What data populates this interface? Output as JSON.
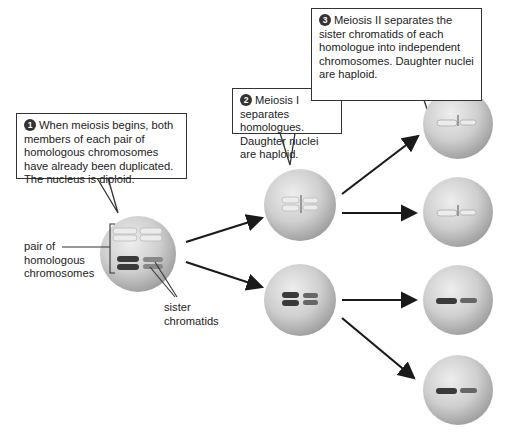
{
  "callouts": [
    {
      "number": "1",
      "text": "When meiosis begins, both members of each pair of homologous chromosomes have already been duplicated. The nucleus is diploid."
    },
    {
      "number": "2",
      "text": "Meiosis I separates homologues. Daughter nuclei are haploid."
    },
    {
      "number": "3",
      "text": "Meiosis II separates the sister chromatids of each homologue into independent chromosomes. Daughter nuclei are haploid."
    }
  ],
  "labels": {
    "homologous_pair": "pair of homologous chromosomes",
    "sister_chromatids": "sister chromatids"
  },
  "cells": [
    {
      "id": "parent",
      "stage": "diploid, duplicated",
      "chromosomes": [
        "light-duplicated",
        "dark-duplicated"
      ]
    },
    {
      "id": "meiosis1-top",
      "stage": "haploid",
      "chromosomes": [
        "light-duplicated"
      ]
    },
    {
      "id": "meiosis1-bottom",
      "stage": "haploid",
      "chromosomes": [
        "dark-duplicated"
      ]
    },
    {
      "id": "meiosis2-1",
      "stage": "haploid",
      "chromosomes": [
        "light-single"
      ]
    },
    {
      "id": "meiosis2-2",
      "stage": "haploid",
      "chromosomes": [
        "light-single"
      ]
    },
    {
      "id": "meiosis2-3",
      "stage": "haploid",
      "chromosomes": [
        "dark-single"
      ]
    },
    {
      "id": "meiosis2-4",
      "stage": "haploid",
      "chromosomes": [
        "dark-single"
      ]
    }
  ],
  "colors": {
    "cell": "#c8c8c8",
    "light_chromosome": "#e9e9e9",
    "dark_chromosome": "#3a3a3a",
    "arrow": "#1a1a1a"
  }
}
